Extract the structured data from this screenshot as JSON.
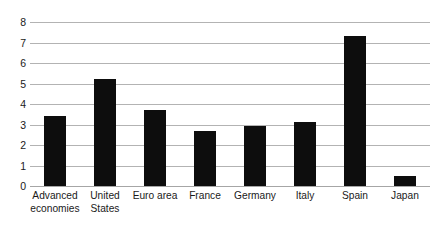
{
  "chart_data": {
    "type": "bar",
    "title": "",
    "xlabel": "",
    "ylabel": "",
    "ylim": [
      0,
      8
    ],
    "grid": true,
    "legend": "none",
    "categories": [
      "Advanced economies",
      "United States",
      "Euro area",
      "France",
      "Germany",
      "Italy",
      "Spain",
      "Japan"
    ],
    "category_lines": [
      [
        "Advanced",
        "economies"
      ],
      [
        "United",
        "States"
      ],
      [
        "Euro area"
      ],
      [
        "France"
      ],
      [
        "Germany"
      ],
      [
        "Italy"
      ],
      [
        "Spain"
      ],
      [
        "Japan"
      ]
    ],
    "values": [
      3.4,
      5.2,
      3.7,
      2.7,
      2.95,
      3.1,
      7.3,
      0.5
    ],
    "y_ticks": [
      0,
      1,
      2,
      3,
      4,
      5,
      6,
      7,
      8
    ],
    "y_tick_labels": [
      "0",
      "1",
      "2",
      "3",
      "4",
      "5",
      "6",
      "7",
      "8"
    ],
    "bar_color": "#0d0d0d",
    "gridline_color": "#b3b3b3",
    "axis_color": "#a6a6a6",
    "background_color": "#ffffff"
  }
}
